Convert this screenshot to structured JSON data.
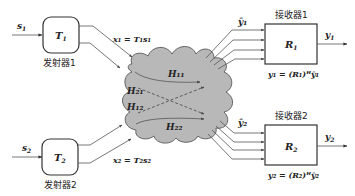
{
  "transmitters": [
    {
      "input": "s",
      "input_sub": "1",
      "block": "T",
      "block_sub": "1",
      "label": "发射器1",
      "output_eq": "x₁ = T₁s₁"
    },
    {
      "input": "s",
      "input_sub": "2",
      "block": "T",
      "block_sub": "2",
      "label": "发射器2",
      "output_eq": "x₂ = T₂s₂"
    }
  ],
  "channel": {
    "labels": [
      "H₁₁",
      "H₂₁",
      "H₁₂",
      "H₂₂"
    ],
    "fill_color": "#b8b8b8"
  },
  "receivers": [
    {
      "input": "ŷ₁",
      "block": "R",
      "block_sub": "1",
      "label": "接收器1",
      "output": "y",
      "output_sub": "1",
      "eq": "y₁ = (R₁)ᴴŷ₁"
    },
    {
      "input": "ŷ₂",
      "block": "R",
      "block_sub": "2",
      "label": "接收器2",
      "output": "y",
      "output_sub": "2",
      "eq": "y₂ = (R₂)ᴴŷ₂"
    }
  ]
}
